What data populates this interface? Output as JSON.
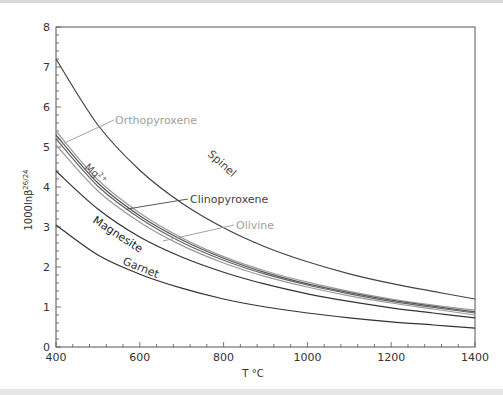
{
  "chart_data": {
    "type": "line",
    "title": "",
    "xlabel": "T °C",
    "ylabel": "1000lnβ26/24",
    "xlim": [
      400,
      1400
    ],
    "ylim": [
      0,
      8
    ],
    "xticks": [
      400,
      600,
      800,
      1000,
      1200,
      1400
    ],
    "yticks": [
      0,
      1,
      2,
      3,
      4,
      5,
      6,
      7,
      8
    ],
    "grid": false,
    "legend": "inline labels",
    "x": [
      400,
      500,
      600,
      700,
      800,
      900,
      1000,
      1100,
      1200,
      1300,
      1400
    ],
    "series": [
      {
        "name": "Spinel",
        "color": "#444444",
        "values": [
          7.2,
          5.55,
          4.42,
          3.6,
          2.98,
          2.5,
          2.13,
          1.83,
          1.59,
          1.39,
          1.2
        ]
      },
      {
        "name": "Orthopyroxene",
        "color": "#999999",
        "values": [
          5.4,
          4.18,
          3.35,
          2.73,
          2.26,
          1.9,
          1.62,
          1.39,
          1.2,
          1.05,
          0.92
        ]
      },
      {
        "name": "Mg2+",
        "color": "#555555",
        "values": [
          5.3,
          4.1,
          3.28,
          2.68,
          2.22,
          1.86,
          1.58,
          1.36,
          1.17,
          1.02,
          0.88
        ]
      },
      {
        "name": "Clinopyroxene",
        "color": "#666666",
        "values": [
          5.2,
          4.02,
          3.22,
          2.62,
          2.17,
          1.82,
          1.55,
          1.33,
          1.14,
          0.99,
          0.85
        ]
      },
      {
        "name": "Olivine",
        "color": "#999999",
        "values": [
          5.05,
          3.9,
          3.12,
          2.54,
          2.1,
          1.76,
          1.5,
          1.28,
          1.1,
          0.95,
          0.8
        ]
      },
      {
        "name": "Magnesite",
        "color": "#333333",
        "values": [
          4.4,
          3.45,
          2.75,
          2.25,
          1.87,
          1.57,
          1.33,
          1.14,
          0.98,
          0.85,
          0.73
        ]
      },
      {
        "name": "Garnet",
        "color": "#333333",
        "values": [
          3.05,
          2.3,
          1.82,
          1.47,
          1.2,
          1.0,
          0.85,
          0.73,
          0.63,
          0.55,
          0.47
        ]
      }
    ],
    "annotations": [
      {
        "text": "Orthopyroxene",
        "color": "#999999",
        "leader_to": [
          410,
          5.05
        ]
      },
      {
        "text": "Clinopyroxene",
        "color": "#444444",
        "leader_to": [
          570,
          3.45
        ]
      },
      {
        "text": "Olivine",
        "color": "#999999",
        "leader_to": [
          655,
          2.65
        ]
      },
      {
        "text": "Spinel",
        "rotated": true
      },
      {
        "text": "Mg2+",
        "rotated": true
      },
      {
        "text": "Magnesite",
        "rotated": true
      },
      {
        "text": "Garnet",
        "rotated": true
      }
    ]
  },
  "labels": {
    "xlabel": "T °C",
    "ylabel_main": "1000lnβ",
    "ylabel_sup": "26/24",
    "spinel": "Spinel",
    "ortho": "Orthopyroxene",
    "mg": "Mg",
    "mg_sup": "2+",
    "clino": "Clinopyroxene",
    "olivine": "Olivine",
    "magnesite": "Magnesite",
    "garnet": "Garnet"
  }
}
